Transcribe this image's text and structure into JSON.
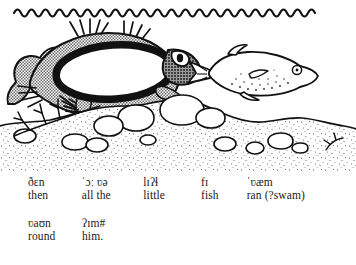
{
  "illustration": {
    "name": "underwater-fish-scene",
    "description": "Line drawing of a large fish with a wide open mouth about to swallow a smaller spotted fish, under a wavy water surface, above a stippled sandy seabed with rocks and seaweed",
    "water_surface": "wavy-line",
    "colors": {
      "ink": "#111111",
      "body_shade": "#9b9b9b",
      "paper": "#ffffff",
      "stipple": "#4a4a4a"
    },
    "elements": [
      "water-surface-wave-line",
      "large-fish",
      "large-fish-open-mouth",
      "large-fish-eye",
      "small-spotted-fish",
      "seabed",
      "rocks",
      "seaweed"
    ]
  },
  "transcription": {
    "line1": [
      {
        "phonetic": "ðɛn",
        "gloss": "then"
      },
      {
        "phonetic": "ˈɔː ʋə",
        "gloss": "all the"
      },
      {
        "phonetic": "lɪʔɬ",
        "gloss": "little"
      },
      {
        "phonetic": "fɪ",
        "gloss": "fish"
      },
      {
        "phonetic": "ˈʋæm",
        "gloss": "ran (?swam)"
      }
    ],
    "line2": [
      {
        "phonetic": "ʋaʊn",
        "gloss": "round"
      },
      {
        "phonetic": "ʔɪm#",
        "gloss": "him."
      }
    ]
  }
}
